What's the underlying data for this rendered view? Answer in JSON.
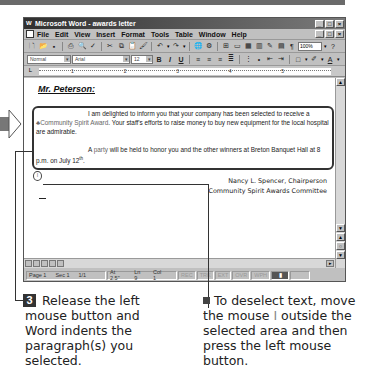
{
  "window": {
    "title": "Microsoft Word - awards letter",
    "controls": [
      "minimize",
      "maximize",
      "close"
    ]
  },
  "menubar": {
    "items": [
      "File",
      "Edit",
      "View",
      "Insert",
      "Format",
      "Tools",
      "Table",
      "Window",
      "Help"
    ]
  },
  "toolbar": {
    "buttons": [
      "new-icon",
      "open-icon",
      "save-icon",
      "print-icon",
      "print-preview-icon",
      "spelling-icon",
      "cut-icon",
      "copy-icon",
      "paste-icon",
      "format-painter-icon",
      "undo-icon",
      "redo-icon",
      "web-icon",
      "hyperlink-icon",
      "tables-icon",
      "insert-table-icon",
      "excel-icon",
      "columns-icon",
      "drawing-icon",
      "document-map-icon",
      "show-hide-icon"
    ],
    "zoom": "100%",
    "help_icon": "?"
  },
  "formatting": {
    "style": "Normal",
    "font": "Arial",
    "size": "12",
    "bold": "B",
    "italic": "I",
    "underline": "U"
  },
  "ruler": {
    "marks": [
      "1",
      "2",
      "3",
      "4",
      "5"
    ]
  },
  "document": {
    "salutation": "Mr. Peterson:",
    "paragraph1": {
      "before": "I am delighted to inform you that your company has been selected to receive a ",
      "highlight": "♣Community Spirit Award",
      "after": ".  Your staff's efforts to raise money to buy new equipment for the local hospital are admirable."
    },
    "paragraph2": {
      "before": "A ",
      "highlight": "party",
      "after": " will be held to honor you and the other winners at Breton Banquet Hall at 8 p.m. on July 12",
      "sup": "th",
      "end": "."
    },
    "pilcrow_marker": "¶",
    "signature_line1": "Nancy L. Spencer, Chairperson",
    "signature_line2": "Community Spirit Awards Committee"
  },
  "statusbar": {
    "page": "Page 1",
    "sec": "Sec 1",
    "pages": "1/1",
    "at": "At 2.5\"",
    "ln": "Ln 9",
    "col": "Col 1",
    "rec": "REC",
    "trk": "TRK",
    "ext": "EXT",
    "ovr": "OVR",
    "wph": "WPH"
  },
  "captions": {
    "step_number": "3",
    "step_text": "Release the left mouse button and Word indents the paragraph(s) you selected.",
    "tip_text_before": "To deselect text, move the mouse ",
    "tip_ibeam": "I",
    "tip_text_after": " outside the selected area and then press the left mouse button."
  }
}
